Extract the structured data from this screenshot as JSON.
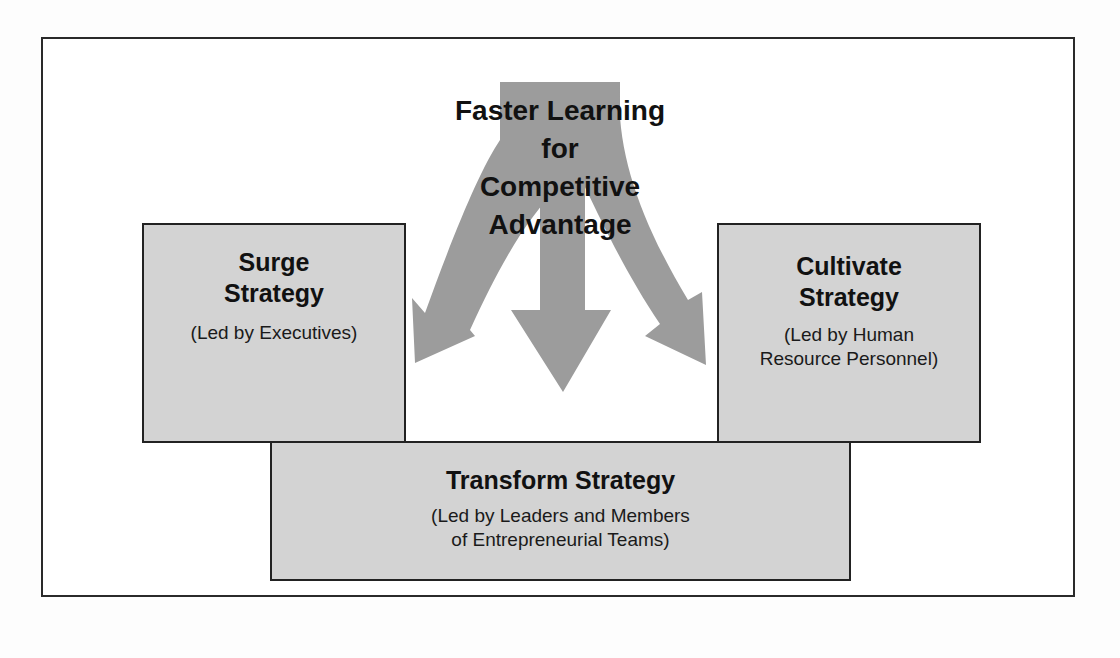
{
  "diagram": {
    "headline": {
      "lines": [
        "Faster Learning",
        "for",
        "Competitive",
        "Advantage"
      ]
    },
    "boxes": {
      "surge": {
        "title_lines": [
          "Surge",
          "Strategy"
        ],
        "subtitle_lines": [
          "(Led by Executives)"
        ]
      },
      "cultivate": {
        "title_lines": [
          "Cultivate",
          "Strategy"
        ],
        "subtitle_lines": [
          "(Led by Human",
          "Resource Personnel)"
        ]
      },
      "transform": {
        "title_lines": [
          "Transform Strategy"
        ],
        "subtitle_lines": [
          "(Led by Leaders and Members",
          "of Entrepreneurial Teams)"
        ]
      }
    },
    "arrows": [
      {
        "name": "arrow-to-surge",
        "direction": "down-left"
      },
      {
        "name": "arrow-to-transform",
        "direction": "down"
      },
      {
        "name": "arrow-to-cultivate",
        "direction": "down-right"
      }
    ],
    "colors": {
      "box_fill": "#d3d3d3",
      "arrow_fill": "#9a9a9a",
      "border": "#222222",
      "text": "#111111"
    }
  }
}
